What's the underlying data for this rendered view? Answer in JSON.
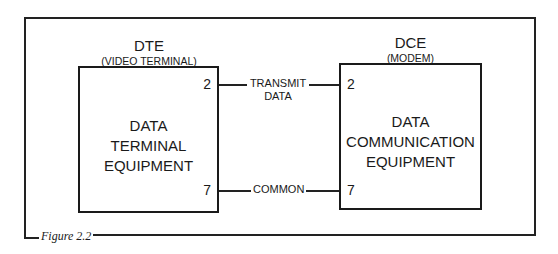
{
  "figure": {
    "caption": "Figure 2.2"
  },
  "dte": {
    "title": "DTE",
    "subtitle": "(VIDEO TERMINAL)",
    "box_lines": [
      "DATA",
      "TERMINAL",
      "EQUIPMENT"
    ],
    "pins": [
      "2",
      "7"
    ]
  },
  "dce": {
    "title": "DCE",
    "subtitle": "(MODEM)",
    "box_lines": [
      "DATA",
      "COMMUNICATION",
      "EQUIPMENT"
    ],
    "pins": [
      "2",
      "7"
    ]
  },
  "connections": [
    {
      "from_pin": "2",
      "to_pin": "2",
      "label_lines": [
        "TRANSMIT",
        "DATA"
      ]
    },
    {
      "from_pin": "7",
      "to_pin": "7",
      "label_lines": [
        "COMMON"
      ]
    }
  ]
}
